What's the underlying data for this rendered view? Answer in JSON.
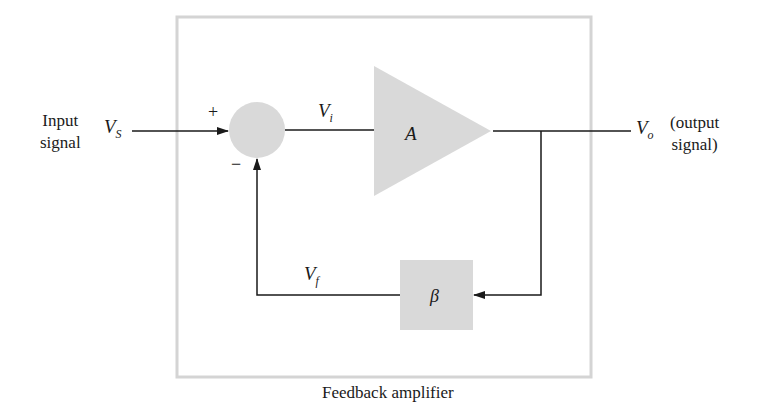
{
  "diagram": {
    "caption": "Feedback amplifier",
    "input": {
      "line1": "Input",
      "line2": "signal",
      "symbol": "V",
      "symbol_sub": "S"
    },
    "output": {
      "line1": "(output",
      "line2": "signal)",
      "symbol": "V",
      "symbol_sub": "o"
    },
    "summer": {
      "plus": "+",
      "minus": "−"
    },
    "amplifier": {
      "label": "A"
    },
    "error_signal": {
      "symbol": "V",
      "symbol_sub": "i"
    },
    "feedback_network": {
      "label": "β"
    },
    "feedback_signal": {
      "symbol": "V",
      "symbol_sub": "f"
    },
    "colors": {
      "block_fill": "#d9d9d9",
      "frame": "#d4d4d4",
      "line": "#1a1a1a"
    }
  }
}
